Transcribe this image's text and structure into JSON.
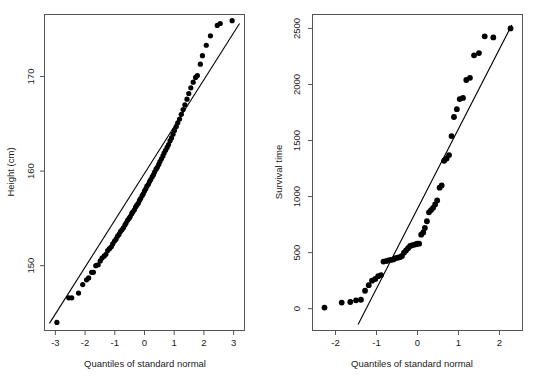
{
  "figure": {
    "background": "#ffffff",
    "point_color": "#000000",
    "line_color": "#000000",
    "axis_color": "#555555"
  },
  "chart_data": [
    {
      "type": "scatter",
      "title": "",
      "panel": "left",
      "xlabel": "Quantiles of standard normal",
      "ylabel": "Height (cm)",
      "xlim": [
        -3.35,
        3.35
      ],
      "ylim": [
        143.2,
        176.5
      ],
      "xticks": [
        -3,
        -2,
        -1,
        0,
        1,
        2,
        3
      ],
      "xticklabels": [
        "-3",
        "-2",
        "-1",
        "0",
        "1",
        "2",
        "3"
      ],
      "yticks": [
        150,
        160,
        170
      ],
      "yticklabels": [
        "150",
        "160",
        "170"
      ],
      "grid": false,
      "legend": null,
      "reference_line": {
        "type": "qq-line",
        "x": [
          -3.2,
          3.2
        ],
        "y": [
          143.9,
          175.6
        ]
      },
      "x": [
        -2.95,
        -2.55,
        -2.45,
        -2.22,
        -2.08,
        -1.95,
        -1.88,
        -1.78,
        -1.72,
        -1.64,
        -1.56,
        -1.49,
        -1.43,
        -1.36,
        -1.3,
        -1.24,
        -1.18,
        -1.12,
        -1.07,
        -1.01,
        -0.96,
        -0.91,
        -0.86,
        -0.81,
        -0.76,
        -0.71,
        -0.66,
        -0.62,
        -0.57,
        -0.52,
        -0.48,
        -0.43,
        -0.39,
        -0.34,
        -0.3,
        -0.26,
        -0.21,
        -0.17,
        -0.13,
        -0.08,
        -0.04,
        0.0,
        0.04,
        0.08,
        0.13,
        0.17,
        0.21,
        0.26,
        0.3,
        0.34,
        0.39,
        0.43,
        0.48,
        0.52,
        0.57,
        0.62,
        0.66,
        0.71,
        0.76,
        0.81,
        0.86,
        0.91,
        0.96,
        1.01,
        1.07,
        1.12,
        1.18,
        1.24,
        1.3,
        1.36,
        1.43,
        1.49,
        1.56,
        1.64,
        1.72,
        1.78,
        1.88,
        1.95,
        2.08,
        2.22,
        2.45,
        2.55,
        2.95
      ],
      "y": [
        144.0,
        146.6,
        146.6,
        147.1,
        148.0,
        148.5,
        148.7,
        149.3,
        149.3,
        150.0,
        150.1,
        150.5,
        150.8,
        151.0,
        151.2,
        151.6,
        151.8,
        152.0,
        152.3,
        152.6,
        152.8,
        153.1,
        153.3,
        153.6,
        153.8,
        154.0,
        154.3,
        154.5,
        154.8,
        155.0,
        155.2,
        155.5,
        155.7,
        155.9,
        156.2,
        156.4,
        156.6,
        156.9,
        157.1,
        157.4,
        157.6,
        157.9,
        158.1,
        158.4,
        158.6,
        158.9,
        159.1,
        159.4,
        159.6,
        159.9,
        160.2,
        160.4,
        160.7,
        161.0,
        161.3,
        161.6,
        161.9,
        162.2,
        162.5,
        162.8,
        163.2,
        163.5,
        163.9,
        164.3,
        164.7,
        165.1,
        165.5,
        166.0,
        166.5,
        167.0,
        167.6,
        168.2,
        168.8,
        169.4,
        169.9,
        170.1,
        171.3,
        172.2,
        173.3,
        174.3,
        175.4,
        175.6,
        175.9
      ]
    },
    {
      "type": "scatter",
      "title": "",
      "panel": "right",
      "xlabel": "Quantiles of standard normal",
      "ylabel": "Survival time",
      "xlim": [
        -2.55,
        2.55
      ],
      "ylim": [
        -190,
        2620
      ],
      "xticks": [
        -2,
        -1,
        0,
        1,
        2
      ],
      "xticklabels": [
        "-2",
        "-1",
        "0",
        "1",
        "2"
      ],
      "yticks": [
        0,
        500,
        1000,
        1500,
        2000,
        2500
      ],
      "yticklabels": [
        "0",
        "500",
        "1000",
        "1500",
        "2000",
        "2500"
      ],
      "grid": false,
      "legend": null,
      "reference_line": {
        "type": "qq-line",
        "x": [
          -1.45,
          2.3
        ],
        "y": [
          -140,
          2530
        ]
      },
      "x": [
        -2.27,
        -1.85,
        -1.64,
        -1.5,
        -1.38,
        -1.28,
        -1.19,
        -1.11,
        -1.03,
        -0.96,
        -0.89,
        -0.83,
        -0.77,
        -0.71,
        -0.65,
        -0.59,
        -0.54,
        -0.48,
        -0.43,
        -0.38,
        -0.33,
        -0.28,
        -0.23,
        -0.18,
        -0.14,
        -0.09,
        -0.04,
        0.0,
        0.04,
        0.09,
        0.14,
        0.18,
        0.23,
        0.28,
        0.33,
        0.38,
        0.43,
        0.48,
        0.54,
        0.59,
        0.65,
        0.71,
        0.77,
        0.83,
        0.89,
        0.96,
        1.03,
        1.11,
        1.19,
        1.28,
        1.38,
        1.5,
        1.64,
        1.85,
        2.27
      ],
      "y": [
        10,
        55,
        60,
        75,
        80,
        160,
        210,
        250,
        265,
        290,
        300,
        420,
        425,
        430,
        435,
        440,
        450,
        455,
        460,
        470,
        500,
        520,
        540,
        560,
        565,
        570,
        575,
        580,
        580,
        660,
        680,
        720,
        780,
        860,
        880,
        900,
        930,
        965,
        1080,
        1100,
        1320,
        1340,
        1370,
        1540,
        1710,
        1780,
        1870,
        1880,
        2040,
        2060,
        2260,
        2280,
        2430,
        2420,
        2500
      ]
    }
  ]
}
